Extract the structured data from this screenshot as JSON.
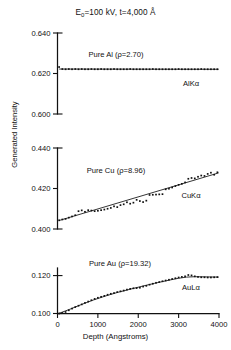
{
  "figure": {
    "title_main_a": "E",
    "title_sub": "0",
    "title_main_b": "=100 kV, t=4,000 Å",
    "ylabel": "Generated Intensity",
    "xlabel": "Depth (Angstroms)"
  },
  "axes": {
    "x_ticks": [
      0,
      1000,
      2000,
      3000,
      4000
    ],
    "x_tick_labels": [
      "0",
      "1000",
      "2000",
      "3000",
      "4000"
    ],
    "xlim": [
      0,
      4000
    ]
  },
  "chart_data": [
    {
      "type": "scatter",
      "panel": "top",
      "title": "Pure Al (ρ=2.70)",
      "material": "Pure Al",
      "density": 2.7,
      "series_label": "AlKα",
      "xlabel": "Depth (Angstroms)",
      "ylabel": "Generated Intensity",
      "xlim": [
        0,
        4000
      ],
      "ylim": [
        0.6,
        0.64
      ],
      "y_ticks": [
        0.6,
        0.62,
        0.64
      ],
      "y_tick_labels": [
        "0.600",
        "0.620",
        "0.640"
      ],
      "grid": false,
      "x": [
        40,
        120,
        200,
        280,
        360,
        440,
        520,
        600,
        680,
        760,
        840,
        920,
        1000,
        1080,
        1160,
        1240,
        1320,
        1400,
        1480,
        1560,
        1640,
        1720,
        1800,
        1880,
        1960,
        2040,
        2120,
        2200,
        2280,
        2360,
        2440,
        2520,
        2600,
        2680,
        2760,
        2840,
        2920,
        3000,
        3080,
        3160,
        3240,
        3320,
        3400,
        3480,
        3560,
        3640,
        3720,
        3800,
        3880,
        3960
      ],
      "y": [
        0.6232,
        0.6222,
        0.6221,
        0.6222,
        0.6221,
        0.6222,
        0.6221,
        0.6222,
        0.6221,
        0.6221,
        0.6222,
        0.6221,
        0.6221,
        0.6222,
        0.6221,
        0.6221,
        0.6221,
        0.6222,
        0.6221,
        0.6221,
        0.6221,
        0.6221,
        0.6222,
        0.6221,
        0.6221,
        0.6221,
        0.6221,
        0.6221,
        0.6221,
        0.6222,
        0.6221,
        0.6221,
        0.6221,
        0.6221,
        0.6221,
        0.6221,
        0.6221,
        0.6222,
        0.6221,
        0.6221,
        0.6221,
        0.6221,
        0.6221,
        0.6221,
        0.6222,
        0.6221,
        0.6221,
        0.6221,
        0.6221,
        0.6221
      ],
      "fit_line": {
        "x": [
          40,
          3990
        ],
        "y": [
          0.6222,
          0.6221
        ]
      }
    },
    {
      "type": "scatter",
      "panel": "middle",
      "title": "Pure Cu (ρ=8.96)",
      "material": "Pure Cu",
      "density": 8.96,
      "series_label": "CuKα",
      "xlabel": "Depth (Angstroms)",
      "ylabel": "Generated Intensity",
      "xlim": [
        0,
        4000
      ],
      "ylim": [
        0.4,
        0.44
      ],
      "y_ticks": [
        0.4,
        0.42,
        0.44
      ],
      "y_tick_labels": [
        "0.400",
        "0.420",
        "0.440"
      ],
      "grid": false,
      "x": [
        40,
        120,
        200,
        280,
        360,
        440,
        520,
        600,
        680,
        760,
        840,
        920,
        1000,
        1080,
        1160,
        1240,
        1320,
        1400,
        1480,
        1560,
        1640,
        1720,
        1800,
        1880,
        1960,
        2040,
        2120,
        2200,
        2280,
        2360,
        2440,
        2520,
        2600,
        2680,
        2760,
        2840,
        2920,
        3000,
        3080,
        3160,
        3240,
        3320,
        3400,
        3480,
        3560,
        3640,
        3720,
        3800,
        3880,
        3960
      ],
      "y": [
        0.4043,
        0.4047,
        0.405,
        0.4056,
        0.4062,
        0.4068,
        0.4088,
        0.4092,
        0.4085,
        0.4093,
        0.4091,
        0.4088,
        0.409,
        0.4093,
        0.4096,
        0.41,
        0.4104,
        0.4112,
        0.4108,
        0.4118,
        0.4122,
        0.4132,
        0.4125,
        0.413,
        0.4144,
        0.4138,
        0.4133,
        0.414,
        0.4168,
        0.4169,
        0.417,
        0.4171,
        0.4172,
        0.4196,
        0.4199,
        0.4205,
        0.4212,
        0.4218,
        0.4223,
        0.423,
        0.4248,
        0.4252,
        0.425,
        0.4258,
        0.4264,
        0.4262,
        0.4272,
        0.4278,
        0.4268,
        0.428
      ],
      "fit_line": {
        "x": [
          40,
          3990
        ],
        "y": [
          0.4042,
          0.4277
        ]
      }
    },
    {
      "type": "scatter",
      "panel": "bottom",
      "title": "Pure Au (ρ=19.32)",
      "material": "Pure Au",
      "density": 19.32,
      "series_label": "AuLα",
      "xlabel": "Depth (Angstroms)",
      "ylabel": "Generated Intensity",
      "xlim": [
        0,
        4000
      ],
      "ylim": [
        0.1,
        0.124
      ],
      "y_ticks": [
        0.1,
        0.12
      ],
      "y_tick_labels": [
        "0.100",
        "0.120"
      ],
      "grid": false,
      "x": [
        40,
        120,
        200,
        280,
        360,
        440,
        520,
        600,
        680,
        760,
        840,
        920,
        1000,
        1080,
        1160,
        1240,
        1320,
        1400,
        1480,
        1560,
        1640,
        1720,
        1800,
        1880,
        1960,
        2040,
        2120,
        2200,
        2280,
        2360,
        2440,
        2520,
        2600,
        2680,
        2760,
        2840,
        2920,
        3000,
        3080,
        3160,
        3240,
        3320,
        3400,
        3480,
        3560,
        3640,
        3720,
        3800,
        3880,
        3960
      ],
      "y": [
        0.1,
        0.1003,
        0.1008,
        0.1017,
        0.1026,
        0.1034,
        0.1041,
        0.1048,
        0.1056,
        0.1063,
        0.107,
        0.1077,
        0.1083,
        0.1088,
        0.1093,
        0.1099,
        0.1104,
        0.1108,
        0.1113,
        0.1117,
        0.1121,
        0.1126,
        0.113,
        0.1133,
        0.1134,
        0.1136,
        0.1142,
        0.1146,
        0.1152,
        0.1157,
        0.1162,
        0.1166,
        0.117,
        0.1174,
        0.1178,
        0.1182,
        0.1186,
        0.119,
        0.1193,
        0.1196,
        0.1203,
        0.1201,
        0.1196,
        0.1193,
        0.1191,
        0.1191,
        0.119,
        0.119,
        0.1191,
        0.1192
      ],
      "fit_line": {
        "x": [
          40,
          300,
          600,
          900,
          1200,
          1500,
          1800,
          2100,
          2400,
          2700,
          3000,
          3200,
          3400,
          3700,
          3990
        ],
        "y": [
          0.1001,
          0.1022,
          0.1048,
          0.1072,
          0.1093,
          0.1112,
          0.1128,
          0.1144,
          0.1159,
          0.1173,
          0.1186,
          0.1192,
          0.1194,
          0.1193,
          0.1192
        ]
      }
    }
  ]
}
